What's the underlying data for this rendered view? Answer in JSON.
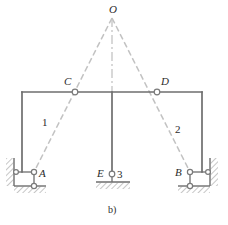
{
  "figure": {
    "caption": "b)",
    "colors": {
      "member": "#6e6e6e",
      "dashed": "#b9b9b9",
      "centerline": "#cfcfcf",
      "joint_fill": "#ffffff",
      "joint_stroke": "#7a7a7a",
      "hatch": "#8a8a8a",
      "text": "#2b2b2b",
      "background": "#ffffff"
    },
    "nodes": [
      {
        "id": "O",
        "label": "O",
        "x": 112,
        "y": 18,
        "has_joint_marker": false,
        "label_dx": -1,
        "label_dy": -14
      },
      {
        "id": "C",
        "label": "C",
        "x": 75,
        "y": 92,
        "has_joint_marker": true,
        "label_dx": -11,
        "label_dy": -14
      },
      {
        "id": "D",
        "label": "D",
        "x": 157,
        "y": 92,
        "has_joint_marker": true,
        "label_dx": 4,
        "label_dy": -14
      },
      {
        "id": "A",
        "label": "A",
        "x": 34,
        "y": 172,
        "has_joint_marker": true,
        "label_dx": 5,
        "label_dy": 4
      },
      {
        "id": "B",
        "label": "B",
        "x": 190,
        "y": 172,
        "has_joint_marker": true,
        "label_dx": -15,
        "label_dy": 4
      },
      {
        "id": "E",
        "label": "E",
        "x": 112,
        "y": 174,
        "has_joint_marker": true,
        "label_dx": -14,
        "label_dy": 3
      }
    ],
    "member_labels": [
      {
        "id": "1",
        "label": "1",
        "x": 44,
        "y": 123
      },
      {
        "id": "2",
        "label": "2",
        "x": 177,
        "y": 130
      },
      {
        "id": "3",
        "label": "3",
        "x": 119,
        "y": 175
      }
    ],
    "beam": {
      "x1": 22,
      "x2": 202,
      "y": 92
    },
    "columns": [
      {
        "id": "left-column",
        "x": 22,
        "y1": 92,
        "y2": 172
      },
      {
        "id": "center-column",
        "x": 112,
        "y1": 92,
        "y2": 174
      },
      {
        "id": "right-column",
        "x": 202,
        "y1": 92,
        "y2": 172
      }
    ],
    "dashed_links": [
      {
        "id": "link-1",
        "x1": 112,
        "y1": 18,
        "x2": 34,
        "y2": 172
      },
      {
        "id": "link-2",
        "x1": 112,
        "y1": 18,
        "x2": 190,
        "y2": 172
      }
    ],
    "centerline": {
      "x": 112,
      "y1": 18,
      "y2": 92
    },
    "supports": [
      {
        "id": "support-A",
        "type": "pin-roller-wall",
        "side": "left"
      },
      {
        "id": "support-B",
        "type": "pin-roller-wall",
        "side": "right"
      },
      {
        "id": "support-E",
        "type": "pin-ground",
        "side": "center"
      }
    ]
  }
}
